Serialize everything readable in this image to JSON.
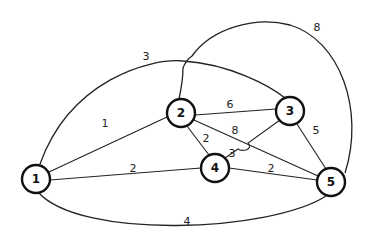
{
  "diagram": {
    "type": "weighted-undirected-graph",
    "nodes": [
      {
        "id": "1",
        "label": "1"
      },
      {
        "id": "2",
        "label": "2"
      },
      {
        "id": "3",
        "label": "3"
      },
      {
        "id": "4",
        "label": "4"
      },
      {
        "id": "5",
        "label": "5"
      }
    ],
    "edges": [
      {
        "from": "1",
        "to": "2",
        "weight": "1"
      },
      {
        "from": "1",
        "to": "4",
        "weight": "2"
      },
      {
        "from": "1",
        "to": "3",
        "weight": "3"
      },
      {
        "from": "1",
        "to": "5",
        "weight": "4"
      },
      {
        "from": "2",
        "to": "3",
        "weight": "6"
      },
      {
        "from": "2",
        "to": "4",
        "weight": "2"
      },
      {
        "from": "2",
        "to": "5",
        "weight": "8"
      },
      {
        "from": "3",
        "to": "4",
        "weight": "3"
      },
      {
        "from": "3",
        "to": "5",
        "weight": "5"
      },
      {
        "from": "2",
        "to": "5",
        "weight": "8",
        "note": "outer arc"
      },
      {
        "from": "4",
        "to": "5",
        "weight": "2"
      }
    ]
  }
}
